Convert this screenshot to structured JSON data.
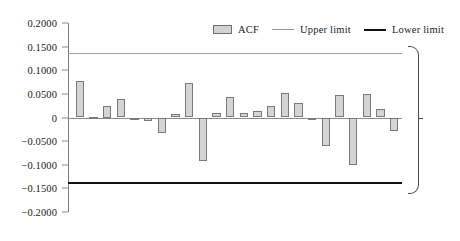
{
  "chart_data": {
    "type": "bar",
    "title": "",
    "xlabel": "",
    "ylabel": "",
    "ylim": [
      -0.2,
      0.2
    ],
    "grid": false,
    "legend_position": "top-right",
    "yticks": [
      "0.2000",
      "0.1500",
      "0.1000",
      "0.0500",
      "0",
      "−0.0500",
      "−0.1000",
      "−0.1500",
      "−0.2000"
    ],
    "ytick_values": [
      0.2,
      0.15,
      0.1,
      0.05,
      0,
      -0.05,
      -0.1,
      -0.15,
      -0.2
    ],
    "categories": [
      1,
      2,
      3,
      4,
      5,
      6,
      7,
      8,
      9,
      10,
      11,
      12,
      13,
      14,
      15,
      16,
      17,
      18,
      19,
      20,
      21,
      22,
      23,
      24
    ],
    "series": [
      {
        "name": "ACF",
        "values": [
          0.078,
          0.002,
          0.025,
          0.039,
          -0.002,
          -0.007,
          -0.033,
          0.008,
          0.073,
          -0.092,
          0.01,
          0.043,
          0.009,
          0.014,
          0.024,
          0.052,
          0.03,
          -0.003,
          -0.06,
          0.048,
          -0.1,
          0.049,
          0.017,
          -0.028
        ]
      }
    ],
    "reference_lines": [
      {
        "name": "Upper limit",
        "value": 0.137
      },
      {
        "name": "Lower limit",
        "value": -0.137
      }
    ],
    "annotation": "95% Confidence\nInterval"
  },
  "legend": {
    "acf_label": "ACF",
    "upper_label": "Upper limit",
    "lower_label": "Lower limit"
  },
  "colors": {
    "bar_fill": "#d4d4d4",
    "bar_stroke": "#7a7a7a",
    "upper_limit": "#9e9e9e",
    "lower_limit": "#111111",
    "axis": "#8a8a8a",
    "text": "#1a1a1a"
  }
}
